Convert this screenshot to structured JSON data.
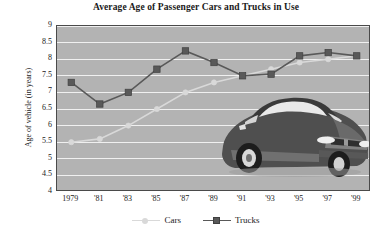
{
  "chart_data": {
    "type": "line",
    "title": "Average Age of Passenger Cars and Trucks in Use",
    "xlabel": "",
    "ylabel": "Age of vehicle (in years)",
    "categories": [
      "1979",
      "'81",
      "'83",
      "'85",
      "'87",
      "'89",
      "'91",
      "'93",
      "'95",
      "'97",
      "'99"
    ],
    "ylim": [
      4,
      9
    ],
    "ytick_labels": [
      "9",
      "8.5",
      "8",
      "7.5",
      "7",
      "6.5",
      "6",
      "5.5",
      "5",
      "4.5",
      "4"
    ],
    "ytick_values": [
      9,
      8.5,
      8,
      7.5,
      7,
      6.5,
      6,
      5.5,
      5,
      4.5,
      4
    ],
    "grid": true,
    "legend_position": "bottom",
    "series": [
      {
        "name": "Cars",
        "marker": "circle",
        "color": "#d9d9d9",
        "values": [
          5.5,
          5.6,
          6.0,
          6.5,
          7.0,
          7.3,
          7.5,
          7.7,
          7.9,
          8.0,
          8.1
        ]
      },
      {
        "name": "Trucks",
        "marker": "square",
        "color": "#595959",
        "values": [
          7.3,
          6.65,
          7.0,
          7.7,
          8.25,
          7.9,
          7.5,
          7.55,
          8.1,
          8.2,
          8.1
        ]
      }
    ],
    "annotations": [
      "car-illustration"
    ]
  },
  "legend": {
    "items": [
      {
        "label": "Cars",
        "marker": "circle-marker",
        "color": "#d9d9d9"
      },
      {
        "label": "Trucks",
        "marker": "square-marker",
        "color": "#595959"
      }
    ]
  },
  "colors": {
    "plot_background": "#b3b3b3",
    "gridline": "#f0f0f0",
    "frame_border": "#4a4a4a",
    "cars_series": "#d9d9d9",
    "trucks_series": "#595959",
    "text": "#1a1a1a",
    "page_background": "#ffffff",
    "car_body": "#5a5a5a",
    "car_glass": "#e8e8e8"
  }
}
